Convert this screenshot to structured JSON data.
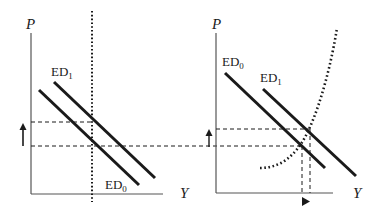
{
  "diagram": {
    "type": "economics-excess-demand-shift",
    "colors": {
      "ink": "#1a1a1a",
      "axis": "#555555"
    },
    "left_panel": {
      "y_axis_label": "P",
      "x_axis_label": "Y",
      "curves": [
        {
          "id": "ED1",
          "label": "ED",
          "subscript": "1",
          "style": "solid"
        },
        {
          "id": "ED0",
          "label": "ED",
          "subscript": "0",
          "style": "solid"
        }
      ],
      "vertical_line": {
        "style": "dotted",
        "meaning": "fixed output"
      },
      "price_levels": [
        "P1 (upper dashed)",
        "P0 (lower dashed)"
      ],
      "arrow": {
        "direction": "up",
        "meaning": "price rises"
      }
    },
    "right_panel": {
      "y_axis_label": "P",
      "x_axis_label": "Y",
      "curves": [
        {
          "id": "ED0",
          "label": "ED",
          "subscript": "0",
          "style": "solid"
        },
        {
          "id": "ED1",
          "label": "ED",
          "subscript": "1",
          "style": "solid"
        },
        {
          "id": "supply",
          "label": "",
          "style": "dotted-convex"
        }
      ],
      "price_levels": [
        "P1 (upper dashed)",
        "P0 (lower dashed, extended from left panel)"
      ],
      "arrow_price": {
        "direction": "up"
      },
      "arrow_output": {
        "direction": "right"
      }
    }
  }
}
